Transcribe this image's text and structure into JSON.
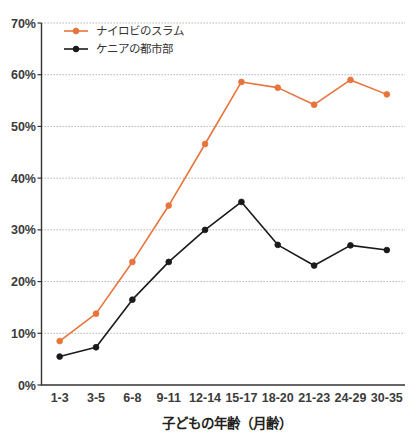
{
  "chart_data": {
    "type": "line",
    "title": "",
    "subtitle": "",
    "xlabel": "子どもの年齢（月齢）",
    "ylabel": "",
    "categories": [
      "1-3",
      "3-5",
      "6-8",
      "9-11",
      "12-14",
      "15-17",
      "18-20",
      "21-23",
      "24-29",
      "30-35"
    ],
    "ylim": [
      0,
      70
    ],
    "ytick_labels": [
      "0%",
      "10%",
      "20%",
      "30%",
      "40%",
      "50%",
      "60%",
      "70%"
    ],
    "ytick_values": [
      0,
      10,
      20,
      30,
      40,
      50,
      60,
      70
    ],
    "grid": true,
    "grid_axis": "y",
    "legend_position": "top-left",
    "series": [
      {
        "name": "ナイロビのスラム",
        "color": "#e8743c",
        "marker": "circle",
        "values": [
          8.5,
          13.8,
          23.8,
          34.7,
          46.6,
          58.6,
          57.5,
          54.2,
          59.0,
          56.2
        ]
      },
      {
        "name": "ケニアの都市部",
        "color": "#1a1a1a",
        "marker": "circle",
        "values": [
          5.5,
          7.3,
          16.5,
          23.8,
          30.0,
          35.4,
          27.1,
          23.1,
          27.0,
          26.1
        ]
      }
    ]
  },
  "colors": {
    "series_1": "#e8743c",
    "series_2": "#1a1a1a",
    "axis": "#333333",
    "grid": "#9a9a9a",
    "text": "#231f20",
    "background": "#ffffff"
  }
}
